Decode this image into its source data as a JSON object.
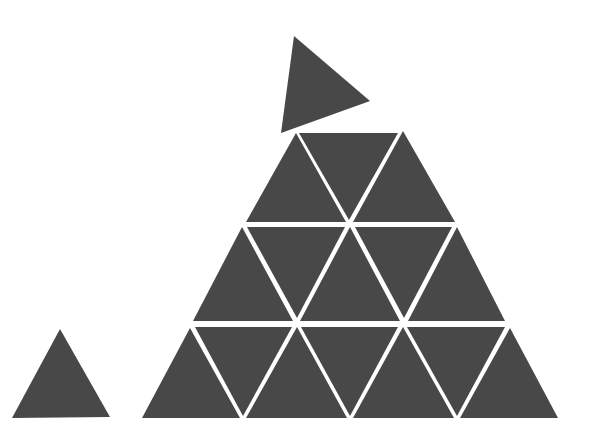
{
  "scene": {
    "description": "Triangle puzzle: pyramid of 15 equilateral triangles with one loose triangle above and one small triangle to the left",
    "background": "#ffffff",
    "fill": "#484848",
    "pyramid": {
      "rows": [
        {
          "row": 1,
          "count": 3,
          "triangles": [
            [
              296,
              133,
              246,
              222,
              346,
              222
            ],
            [
              299,
              133,
              398,
              133,
              349,
              220
            ],
            [
              403,
              131,
              353,
              222,
              455,
              222
            ]
          ]
        },
        {
          "row": 2,
          "count": 5,
          "triangles": [
            [
              242,
              227,
              193,
              321,
              293,
              321
            ],
            [
              247,
              227,
              345,
              227,
              297,
              318
            ],
            [
              350,
              227,
              300,
              321,
              400,
              321
            ],
            [
              355,
              227,
              452,
              227,
              404,
              318
            ],
            [
              457,
              227,
              408,
              321,
              505,
              321
            ]
          ]
        },
        {
          "row": 3,
          "count": 7,
          "triangles": [
            [
              190,
              328,
              142,
              418,
              240,
              418
            ],
            [
              195,
              327,
              292,
              327,
              243,
              416
            ],
            [
              297,
              327,
              246,
              418,
              347,
              418
            ],
            [
              301,
              327,
              398,
              327,
              350,
              416
            ],
            [
              403,
              327,
              353,
              418,
              454,
              418
            ],
            [
              407,
              327,
              505,
              327,
              457,
              416
            ],
            [
              510,
              328,
              460,
              418,
              558,
              418
            ]
          ]
        }
      ]
    },
    "loose_triangle": [
      294,
      36,
      370,
      101,
      281,
      133
    ],
    "small_triangle": [
      60,
      329,
      12,
      418,
      110,
      417
    ]
  }
}
